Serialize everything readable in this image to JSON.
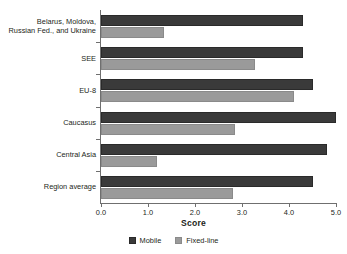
{
  "chart_data": {
    "type": "bar",
    "orientation": "horizontal",
    "title": "",
    "xlabel": "Score",
    "ylabel": "",
    "xlim": [
      0.0,
      5.0
    ],
    "xticks": [
      "0.0",
      "1.0",
      "2.0",
      "3.0",
      "4.0",
      "5.0"
    ],
    "xtick_values": [
      0.0,
      1.0,
      2.0,
      3.0,
      4.0,
      5.0
    ],
    "grid": false,
    "legend_position": "bottom",
    "categories": [
      "Belarus, Moldova,\nRussian Fed., and Ukraine",
      "SEE",
      "EU-8",
      "Caucasus",
      "Central Asia",
      "Region average"
    ],
    "category_lines": [
      [
        "Belarus, Moldova,",
        "Russian Fed., and Ukraine"
      ],
      [
        "SEE"
      ],
      [
        "EU-8"
      ],
      [
        "Caucasus"
      ],
      [
        "Central Asia"
      ],
      [
        "Region average"
      ]
    ],
    "series": [
      {
        "name": "Mobile",
        "color": "#3a3a3a",
        "values": [
          4.3,
          4.3,
          4.5,
          5.0,
          4.8,
          4.5
        ]
      },
      {
        "name": "Fixed-line",
        "color": "#9a9a9a",
        "values": [
          1.35,
          3.27,
          4.1,
          2.85,
          1.2,
          2.8
        ]
      }
    ]
  },
  "legend": {
    "items": [
      {
        "label": "Mobile",
        "color": "#3a3a3a"
      },
      {
        "label": "Fixed-line",
        "color": "#9a9a9a"
      }
    ]
  },
  "axis": {
    "x_title": "Score"
  }
}
